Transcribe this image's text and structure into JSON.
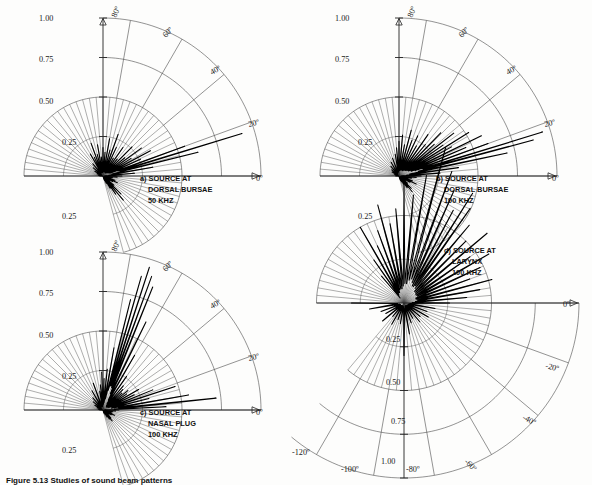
{
  "figure": {
    "caption": "Figure 5.13  Studies of sound beam patterns",
    "caption_visible": "partially clipped at bottom edge"
  },
  "panels": [
    {
      "id": "a",
      "caption_lines": [
        "a) SOURCE AT",
        "DORSAL BURSAE",
        "50 KHZ"
      ],
      "radial_ticks": [
        "0.25",
        "0.50",
        "0.75",
        "1.00"
      ],
      "radial_tick_below": "0.25",
      "angle_ticks": [
        "0º",
        "20º",
        "40º",
        "60º",
        "80º"
      ],
      "outer_radius_value": 1.0,
      "inner_fan_radius_value": 0.5
    },
    {
      "id": "b",
      "caption_lines": [
        "b) SOURCE AT",
        "DORSAL BURSAE",
        "100 KHZ"
      ],
      "radial_ticks": [
        "0.25",
        "0.50",
        "0.75",
        "1.00"
      ],
      "radial_tick_below": "0.25",
      "angle_ticks": [
        "0º",
        "20º",
        "40º",
        "60º",
        "80º"
      ],
      "outer_radius_value": 1.0,
      "inner_fan_radius_value": 0.5
    },
    {
      "id": "c",
      "caption_lines": [
        "c) SOURCE AT",
        "NASAL PLUG",
        "100 KHZ"
      ],
      "radial_ticks": [
        "0.25",
        "0.50",
        "0.75",
        "1.00"
      ],
      "radial_tick_below": "0.25",
      "angle_ticks": [
        "0º",
        "20º",
        "40º",
        "60º",
        "80º"
      ],
      "outer_radius_value": 1.0,
      "inner_fan_radius_value": 0.5
    },
    {
      "id": "d",
      "caption_lines": [
        "d) SOURCE AT",
        "LARYNX",
        "100 KHZ"
      ],
      "radial_ticks": [
        "0.25",
        "0.50",
        "0.75",
        "1.00"
      ],
      "angle_ticks": [
        "0º",
        "-20º",
        "-40º",
        "-60º",
        "-80º",
        "-100º",
        "-120º"
      ],
      "outer_radius_value": 1.0,
      "inner_fan_radius_value": 0.5
    }
  ],
  "chart_data": {
    "type": "line",
    "plot_kind": "polar-directivity",
    "rlabel": "normalized amplitude",
    "thetalabel": "angle (degrees)",
    "rlim": [
      0,
      1.0
    ],
    "grid": true,
    "legend": "none",
    "panels": [
      {
        "id": "a",
        "label": "a) SOURCE AT DORSAL BURSAE 50 KHZ",
        "theta_range_deg": [
          -75,
          180
        ],
        "theta_labeled_deg": [
          0,
          20,
          40,
          60,
          80
        ],
        "r_ticks": [
          0.25,
          0.5,
          0.75,
          1.0
        ],
        "theta_step_deg": 5,
        "main_lobe_deg": 17,
        "main_lobe_r": 0.92,
        "series": [
          {
            "name": "beam",
            "theta_deg": [
              -75,
              -70,
              -65,
              -60,
              -55,
              -50,
              -45,
              -40,
              -35,
              -30,
              -25,
              -20,
              -15,
              -10,
              -5,
              0,
              5,
              10,
              14,
              17,
              20,
              24,
              28,
              32,
              36,
              40,
              45,
              50,
              55,
              60,
              65,
              70,
              75,
              80,
              85,
              90,
              95,
              100,
              105,
              110,
              115,
              120,
              130,
              140,
              150,
              160,
              170,
              180
            ],
            "r": [
              0.02,
              0.03,
              0.05,
              0.09,
              0.14,
              0.2,
              0.16,
              0.09,
              0.05,
              0.07,
              0.1,
              0.08,
              0.05,
              0.06,
              0.09,
              0.12,
              0.2,
              0.32,
              0.62,
              0.92,
              0.55,
              0.26,
              0.34,
              0.21,
              0.3,
              0.18,
              0.26,
              0.14,
              0.22,
              0.13,
              0.2,
              0.28,
              0.17,
              0.24,
              0.15,
              0.18,
              0.12,
              0.2,
              0.14,
              0.22,
              0.13,
              0.16,
              0.1,
              0.08,
              0.06,
              0.04,
              0.03,
              0.02
            ]
          }
        ]
      },
      {
        "id": "b",
        "label": "b) SOURCE AT DORSAL BURSAE 100 KHZ",
        "theta_range_deg": [
          -75,
          180
        ],
        "theta_labeled_deg": [
          0,
          20,
          40,
          60,
          80
        ],
        "r_ticks": [
          0.25,
          0.5,
          0.75,
          1.0
        ],
        "theta_step_deg": 5,
        "main_lobe_deg": 17,
        "main_lobe_r": 0.95,
        "series": [
          {
            "name": "beam",
            "theta_deg": [
              -75,
              -70,
              -65,
              -60,
              -55,
              -50,
              -45,
              -40,
              -35,
              -30,
              -25,
              -20,
              -15,
              -10,
              -5,
              0,
              4,
              8,
              12,
              15,
              17,
              20,
              23,
              26,
              29,
              32,
              35,
              38,
              42,
              46,
              50,
              55,
              60,
              65,
              70,
              75,
              80,
              85,
              90,
              95,
              100,
              110,
              120,
              130,
              140,
              150,
              160,
              170,
              180
            ],
            "r": [
              0.02,
              0.03,
              0.04,
              0.06,
              0.09,
              0.13,
              0.11,
              0.07,
              0.05,
              0.08,
              0.12,
              0.09,
              0.06,
              0.08,
              0.11,
              0.14,
              0.26,
              0.38,
              0.7,
              0.88,
              0.95,
              0.6,
              0.46,
              0.58,
              0.38,
              0.52,
              0.34,
              0.44,
              0.3,
              0.38,
              0.26,
              0.32,
              0.22,
              0.28,
              0.24,
              0.3,
              0.2,
              0.26,
              0.22,
              0.18,
              0.14,
              0.12,
              0.1,
              0.08,
              0.06,
              0.05,
              0.03,
              0.02,
              0.02
            ]
          }
        ]
      },
      {
        "id": "c",
        "label": "c) SOURCE AT NASAL PLUG 100 KHZ",
        "theta_range_deg": [
          -75,
          180
        ],
        "theta_labeled_deg": [
          0,
          20,
          40,
          60,
          80
        ],
        "r_ticks": [
          0.25,
          0.5,
          0.75,
          1.0
        ],
        "theta_step_deg": 5,
        "main_lobe_deg": 72,
        "main_lobe_r": 0.95,
        "series": [
          {
            "name": "beam",
            "theta_deg": [
              -75,
              -70,
              -65,
              -60,
              -55,
              -50,
              -45,
              -40,
              -35,
              -30,
              -25,
              -20,
              -15,
              -10,
              -5,
              0,
              3,
              6,
              10,
              14,
              18,
              22,
              26,
              30,
              34,
              38,
              42,
              46,
              50,
              55,
              60,
              64,
              68,
              70,
              72,
              74,
              76,
              80,
              84,
              88,
              92,
              96,
              100,
              110,
              120,
              130,
              140,
              150,
              160,
              170,
              180
            ],
            "r": [
              0.02,
              0.02,
              0.03,
              0.05,
              0.07,
              0.09,
              0.07,
              0.05,
              0.04,
              0.06,
              0.08,
              0.06,
              0.05,
              0.06,
              0.08,
              0.1,
              0.4,
              0.72,
              0.55,
              0.3,
              0.48,
              0.34,
              0.22,
              0.26,
              0.18,
              0.2,
              0.16,
              0.18,
              0.2,
              0.26,
              0.4,
              0.62,
              0.84,
              0.9,
              0.95,
              0.88,
              0.72,
              0.4,
              0.26,
              0.2,
              0.24,
              0.16,
              0.12,
              0.18,
              0.14,
              0.1,
              0.08,
              0.06,
              0.04,
              0.03,
              0.02
            ]
          }
        ]
      },
      {
        "id": "d",
        "label": "d) SOURCE AT LARYNX 100 KHZ",
        "theta_range_deg": [
          -130,
          180
        ],
        "theta_labeled_deg": [
          0,
          -20,
          -40,
          -60,
          -80,
          -100,
          -120
        ],
        "r_ticks": [
          0.25,
          0.5,
          0.75,
          1.0
        ],
        "theta_step_deg": 5,
        "main_lobe_deg": -75,
        "main_lobe_r": 0.92,
        "series": [
          {
            "name": "beam",
            "theta_deg": [
              180,
              170,
              160,
              150,
              140,
              130,
              120,
              110,
              100,
              90,
              80,
              70,
              60,
              50,
              40,
              30,
              20,
              10,
              0,
              -5,
              -10,
              -15,
              -20,
              -25,
              -30,
              -35,
              -40,
              -45,
              -50,
              -55,
              -58,
              -62,
              -66,
              -70,
              -75,
              -80,
              -85,
              -90,
              -95,
              -100,
              -105,
              -110,
              -115,
              -120,
              -125,
              -130
            ],
            "r": [
              0.3,
              0.2,
              0.14,
              0.12,
              0.16,
              0.1,
              0.14,
              0.1,
              0.12,
              0.3,
              0.18,
              0.12,
              0.1,
              0.14,
              0.12,
              0.16,
              0.14,
              0.18,
              0.26,
              0.36,
              0.44,
              0.52,
              0.4,
              0.48,
              0.56,
              0.46,
              0.62,
              0.5,
              0.58,
              0.66,
              0.74,
              0.6,
              0.7,
              0.8,
              0.92,
              0.74,
              0.62,
              0.68,
              0.54,
              0.46,
              0.58,
              0.44,
              0.36,
              0.5,
              0.3,
              0.2
            ]
          }
        ]
      }
    ]
  }
}
